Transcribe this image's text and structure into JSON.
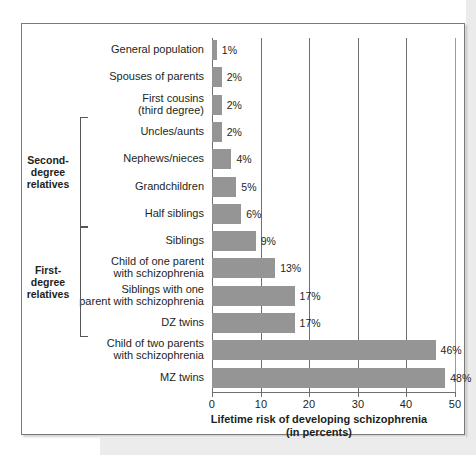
{
  "chart_data": {
    "type": "bar",
    "orientation": "horizontal",
    "title": "",
    "xlabel": "Lifetime risk of developing schizophrenia\n(in percents)",
    "xlabel_line1": "Lifetime risk of developing schizophrenia",
    "xlabel_line2": "(in percents)",
    "ylabel": "",
    "xlim": [
      0,
      50
    ],
    "xticks": [
      0,
      10,
      20,
      30,
      40,
      50
    ],
    "xtick_labels": [
      "0",
      "10",
      "20",
      "30",
      "40",
      "50"
    ],
    "grid": true,
    "legend": false,
    "bar_color": "#959595",
    "categories": [
      "General population",
      "Spouses of parents",
      "First cousins (third degree)",
      "Uncles/aunts",
      "Nephews/nieces",
      "Grandchildren",
      "Half siblings",
      "Siblings",
      "Child of one parent with schizophrenia",
      "Siblings with one parent with schizophrenia",
      "DZ twins",
      "Child of two parents with schizophrenia",
      "MZ twins"
    ],
    "values": [
      1,
      2,
      2,
      2,
      4,
      5,
      6,
      9,
      13,
      17,
      17,
      46,
      48
    ],
    "value_labels": [
      "1%",
      "2%",
      "2%",
      "2%",
      "4%",
      "5%",
      "6%",
      "9%",
      "13%",
      "17%",
      "17%",
      "46%",
      "48%"
    ]
  },
  "bars": [
    {
      "label_lines": [
        "General population"
      ],
      "value": 1,
      "value_label": "1%"
    },
    {
      "label_lines": [
        "Spouses of parents"
      ],
      "value": 2,
      "value_label": "2%"
    },
    {
      "label_lines": [
        "First cousins",
        "(third degree)"
      ],
      "value": 2,
      "value_label": "2%"
    },
    {
      "label_lines": [
        "Uncles/aunts"
      ],
      "value": 2,
      "value_label": "2%"
    },
    {
      "label_lines": [
        "Nephews/nieces"
      ],
      "value": 4,
      "value_label": "4%"
    },
    {
      "label_lines": [
        "Grandchildren"
      ],
      "value": 5,
      "value_label": "5%"
    },
    {
      "label_lines": [
        "Half siblings"
      ],
      "value": 6,
      "value_label": "6%"
    },
    {
      "label_lines": [
        "Siblings"
      ],
      "value": 9,
      "value_label": "9%"
    },
    {
      "label_lines": [
        "Child of one parent",
        "with schizophrenia"
      ],
      "value": 13,
      "value_label": "13%"
    },
    {
      "label_lines": [
        "Siblings with one",
        "parent with schizophrenia"
      ],
      "value": 17,
      "value_label": "17%"
    },
    {
      "label_lines": [
        "DZ twins"
      ],
      "value": 17,
      "value_label": "17%"
    },
    {
      "label_lines": [
        "Child of two parents",
        "with schizophrenia"
      ],
      "value": 46,
      "value_label": "46%"
    },
    {
      "label_lines": [
        "MZ twins"
      ],
      "value": 48,
      "value_label": "48%"
    }
  ],
  "groups": [
    {
      "label_lines": [
        "Second-",
        "degree",
        "relatives"
      ],
      "first_index": 3,
      "last_index": 6
    },
    {
      "label_lines": [
        "First-",
        "degree",
        "relatives"
      ],
      "first_index": 7,
      "last_index": 10
    }
  ],
  "axis": {
    "title_line1": "Lifetime risk of developing schizophrenia",
    "title_line2": "(in percents)",
    "ticks": [
      "0",
      "10",
      "20",
      "30",
      "40",
      "50"
    ]
  }
}
